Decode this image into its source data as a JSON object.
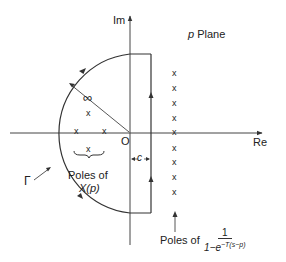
{
  "diagram": {
    "title": "p Plane",
    "title_var": "p",
    "title_text": "Plane",
    "axes": {
      "imaginary_label": "Im",
      "real_label": "Re",
      "origin_label": "O"
    },
    "contour": {
      "label": "Γ",
      "radius_label": "∞",
      "offset_label": "c"
    },
    "annotations": {
      "left_poles_symbol": "x",
      "left_poles_label_line1": "Poles of",
      "left_poles_label_line2": "X(p)",
      "right_poles_label": "Poles of",
      "right_poles_fraction_numerator": "1",
      "right_poles_fraction_denominator_base": "1−e",
      "right_poles_fraction_denominator_exp": "−T(s−p)"
    },
    "pole_marker": "x",
    "colors": {
      "line": "#333333",
      "text": "#222222",
      "background": "#ffffff"
    }
  }
}
